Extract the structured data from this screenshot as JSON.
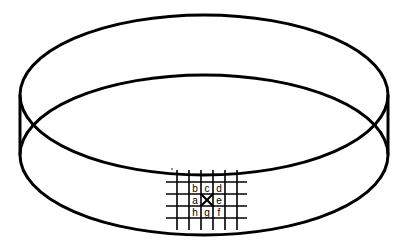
{
  "diagram": {
    "type": "petri-dish-with-grid",
    "stroke_color": "#000000",
    "background": "#ffffff",
    "grid": {
      "rows": [
        [
          "",
          "b",
          "c",
          "d",
          ""
        ],
        [
          "",
          "a",
          "X",
          "e",
          ""
        ],
        [
          "",
          "h",
          "g",
          "f",
          ""
        ]
      ],
      "center_mark": "X"
    },
    "labels": {
      "a": "a",
      "b": "b",
      "c": "c",
      "d": "d",
      "e": "e",
      "f": "f",
      "g": "g",
      "h": "h"
    }
  }
}
